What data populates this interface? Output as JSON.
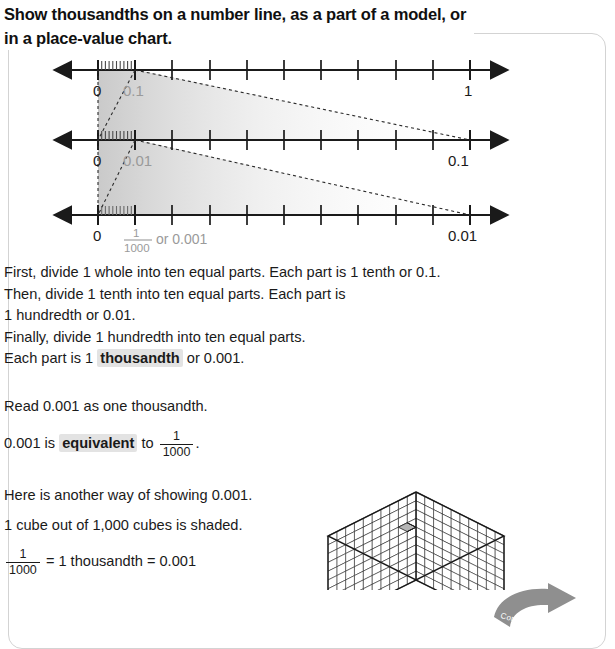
{
  "heading": "Show thousandths on a number line, as a part of a model, or in a place-value chart.",
  "numberlines": [
    {
      "name": "tenths",
      "zero_label": "0",
      "segment_label": "0.1",
      "end_label": "1",
      "major_ticks": 10,
      "minor_ticks": 10
    },
    {
      "name": "hundredths",
      "zero_label": "0",
      "segment_label": "0.01",
      "end_label": "0.1",
      "major_ticks": 10,
      "minor_ticks": 10
    },
    {
      "name": "thousandths",
      "zero_label": "0",
      "segment_numerator": "1",
      "segment_denominator": "1000",
      "segment_suffix": "or 0.001",
      "end_label": "0.01",
      "major_ticks": 10,
      "minor_ticks": 10
    }
  ],
  "body": {
    "steps": [
      "First, divide 1 whole into ten equal parts. Each part is 1 tenth or 0.1.",
      "Then, divide 1 tenth into ten equal parts. Each part is",
      "1 hundredth or 0.01.",
      "Finally, divide 1 hundredth into ten equal parts."
    ],
    "step_last_prefix": "Each part is 1 ",
    "step_last_keyword": "thousandth",
    "step_last_suffix": " or 0.001.",
    "read_line": "Read 0.001 as one thousandth.",
    "equiv_prefix": "0.001 is ",
    "equiv_keyword": "equivalent",
    "equiv_middle": " to ",
    "equiv_numerator": "1",
    "equiv_denominator": "1000",
    "equiv_suffix": ".",
    "here_line": "Here is another way of showing 0.001.",
    "cube_line": "1 cube out of 1,000 cubes is shaded.",
    "final_numerator": "1",
    "final_denominator": "1000",
    "final_rest": "= 1 thousandth = 0.001"
  },
  "cube": {
    "grid": 10,
    "shaded_count": 1,
    "shaded_fill": "#b5b5b5",
    "line_color": "#1a1a1a"
  },
  "continued": {
    "label": "Continued on next page",
    "fill": "#8f8f8f"
  },
  "colors": {
    "text": "#1a1a1a",
    "gray_label": "#9a9a9a",
    "axis": "#1a1a1a",
    "frame": "#d3d3d3",
    "highlight": "#e3e3e3"
  }
}
